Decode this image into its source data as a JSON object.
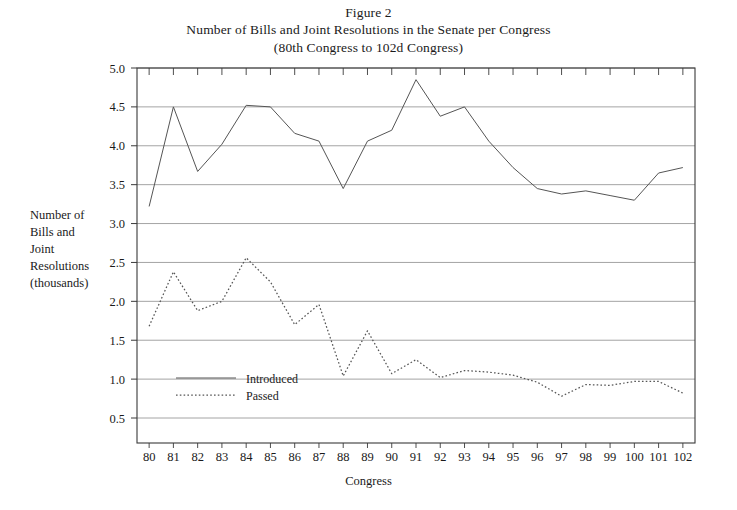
{
  "figure": {
    "title_line1": "Figure 2",
    "title_line2": "Number of Bills and Joint Resolutions in the Senate per Congress",
    "title_line3": "(80th Congress to 102d Congress)"
  },
  "axis": {
    "y_label_line1": "Number of",
    "y_label_line2": "Bills and",
    "y_label_line3": "Joint",
    "y_label_line4": "Resolutions",
    "y_label_line5": "(thousands)",
    "x_label": "Congress"
  },
  "legend": {
    "introduced_label": "Introduced",
    "passed_label": "Passed"
  },
  "colors": {
    "line": "#555555",
    "gridline": "#9a9a9a",
    "axis": "#3a3a3a",
    "background": "#ffffff",
    "text": "#1a1a1a"
  },
  "chart_data": {
    "type": "line",
    "title": "Number of Bills and Joint Resolutions in the Senate per Congress (80th Congress to 102d Congress)",
    "subtitle": "Figure 2",
    "xlabel": "Congress",
    "ylabel": "Number of Bills and Joint Resolutions (thousands)",
    "xlim": [
      79.5,
      102.5
    ],
    "ylim": [
      0.25,
      5.0
    ],
    "grid": true,
    "legend_position": "inside-lower-left",
    "x": [
      80,
      81,
      82,
      83,
      84,
      85,
      86,
      87,
      88,
      89,
      90,
      91,
      92,
      93,
      94,
      95,
      96,
      97,
      98,
      99,
      100,
      101,
      102
    ],
    "xtick_labels": [
      "80",
      "81",
      "82",
      "83",
      "84",
      "85",
      "86",
      "87",
      "88",
      "89",
      "90",
      "91",
      "92",
      "93",
      "94",
      "95",
      "96",
      "97",
      "98",
      "99",
      "100",
      "101",
      "102"
    ],
    "ytick_labels": [
      "0.5",
      "1.0",
      "1.5",
      "2.0",
      "2.5",
      "3.0",
      "3.5",
      "4.0",
      "4.5",
      "5.0"
    ],
    "yticks": [
      0.5,
      1.0,
      1.5,
      2.0,
      2.5,
      3.0,
      3.5,
      4.0,
      4.5,
      5.0
    ],
    "series": [
      {
        "name": "Introduced",
        "style": "solid",
        "values": [
          3.22,
          4.5,
          3.67,
          4.02,
          4.52,
          4.5,
          4.16,
          4.06,
          3.45,
          4.06,
          4.2,
          4.85,
          4.38,
          4.5,
          4.06,
          3.72,
          3.45,
          3.38,
          3.42,
          3.36,
          3.3,
          3.65,
          3.72
        ]
      },
      {
        "name": "Passed",
        "style": "dotted",
        "values": [
          1.68,
          2.38,
          1.88,
          2.0,
          2.56,
          2.25,
          1.7,
          1.96,
          1.04,
          1.62,
          1.07,
          1.25,
          1.02,
          1.11,
          1.09,
          1.05,
          0.96,
          0.78,
          0.93,
          0.92,
          0.97,
          0.97,
          0.82
        ]
      }
    ]
  }
}
